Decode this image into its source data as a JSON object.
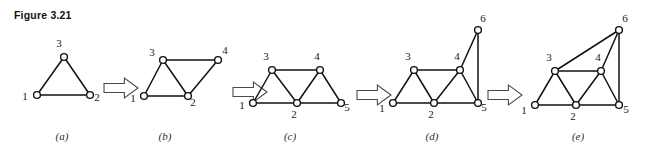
{
  "figure": {
    "caption": "Figure 3.21",
    "background_color": "#ffffff",
    "edge_color": "#111111",
    "vertex_fill_color": "#ffffff",
    "arrow_fill_color": "#ffffff",
    "arrow_stroke_color": "#4a4a4a"
  },
  "panels": [
    {
      "id": "a",
      "label": "(a)",
      "label_x": 62,
      "label_y": 140,
      "vertices": [
        {
          "id": "1",
          "x": 37,
          "y": 95,
          "label": "1",
          "label_x": 25,
          "label_y": 100
        },
        {
          "id": "2",
          "x": 90,
          "y": 95,
          "label": "2",
          "label_x": 97,
          "label_y": 101
        },
        {
          "id": "3",
          "x": 64,
          "y": 57,
          "label": "3",
          "label_x": 59,
          "label_y": 47
        }
      ],
      "edges": [
        {
          "from": "1",
          "to": "2"
        },
        {
          "from": "1",
          "to": "3"
        },
        {
          "from": "2",
          "to": "3"
        }
      ]
    },
    {
      "id": "b",
      "label": "(b)",
      "label_x": 165,
      "label_y": 140,
      "vertices": [
        {
          "id": "1",
          "x": 144,
          "y": 96,
          "label": "1",
          "label_x": 133,
          "label_y": 102
        },
        {
          "id": "2",
          "x": 188,
          "y": 96,
          "label": "2",
          "label_x": 193,
          "label_y": 106
        },
        {
          "id": "3",
          "x": 163,
          "y": 60,
          "label": "3",
          "label_x": 152,
          "label_y": 56
        },
        {
          "id": "4",
          "x": 218,
          "y": 60,
          "label": "4",
          "label_x": 225,
          "label_y": 54
        }
      ],
      "edges": [
        {
          "from": "1",
          "to": "2"
        },
        {
          "from": "1",
          "to": "3"
        },
        {
          "from": "2",
          "to": "3"
        },
        {
          "from": "3",
          "to": "4"
        },
        {
          "from": "2",
          "to": "4"
        }
      ]
    },
    {
      "id": "c",
      "label": "(c)",
      "label_x": 290,
      "label_y": 140,
      "vertices": [
        {
          "id": "1",
          "x": 253,
          "y": 103,
          "label": "1",
          "label_x": 242,
          "label_y": 109
        },
        {
          "id": "2",
          "x": 297,
          "y": 103,
          "label": "2",
          "label_x": 294,
          "label_y": 118
        },
        {
          "id": "3",
          "x": 272,
          "y": 70,
          "label": "3",
          "label_x": 266,
          "label_y": 60
        },
        {
          "id": "4",
          "x": 320,
          "y": 70,
          "label": "4",
          "label_x": 317,
          "label_y": 60
        },
        {
          "id": "5",
          "x": 341,
          "y": 103,
          "label": "5",
          "label_x": 347,
          "label_y": 111
        }
      ],
      "edges": [
        {
          "from": "1",
          "to": "2"
        },
        {
          "from": "2",
          "to": "5"
        },
        {
          "from": "1",
          "to": "3"
        },
        {
          "from": "2",
          "to": "3"
        },
        {
          "from": "3",
          "to": "4"
        },
        {
          "from": "2",
          "to": "4"
        },
        {
          "from": "4",
          "to": "5"
        }
      ]
    },
    {
      "id": "d",
      "label": "(d)",
      "label_x": 432,
      "label_y": 140,
      "vertices": [
        {
          "id": "1",
          "x": 393,
          "y": 103,
          "label": "1",
          "label_x": 382,
          "label_y": 112
        },
        {
          "id": "2",
          "x": 434,
          "y": 103,
          "label": "2",
          "label_x": 431,
          "label_y": 118
        },
        {
          "id": "3",
          "x": 414,
          "y": 70,
          "label": "3",
          "label_x": 408,
          "label_y": 60
        },
        {
          "id": "4",
          "x": 460,
          "y": 70,
          "label": "4",
          "label_x": 457,
          "label_y": 60
        },
        {
          "id": "5",
          "x": 478,
          "y": 103,
          "label": "5",
          "label_x": 484,
          "label_y": 111
        },
        {
          "id": "6",
          "x": 478,
          "y": 30,
          "label": "6",
          "label_x": 483,
          "label_y": 22
        }
      ],
      "edges": [
        {
          "from": "1",
          "to": "2"
        },
        {
          "from": "2",
          "to": "5"
        },
        {
          "from": "1",
          "to": "3"
        },
        {
          "from": "2",
          "to": "3"
        },
        {
          "from": "3",
          "to": "4"
        },
        {
          "from": "2",
          "to": "4"
        },
        {
          "from": "4",
          "to": "5"
        },
        {
          "from": "4",
          "to": "6"
        },
        {
          "from": "5",
          "to": "6"
        }
      ]
    },
    {
      "id": "e",
      "label": "(e)",
      "label_x": 578,
      "label_y": 140,
      "vertices": [
        {
          "id": "1",
          "x": 535,
          "y": 105,
          "label": "1",
          "label_x": 524,
          "label_y": 114
        },
        {
          "id": "2",
          "x": 576,
          "y": 105,
          "label": "2",
          "label_x": 573,
          "label_y": 120
        },
        {
          "id": "3",
          "x": 555,
          "y": 71,
          "label": "3",
          "label_x": 549,
          "label_y": 61
        },
        {
          "id": "4",
          "x": 601,
          "y": 71,
          "label": "4",
          "label_x": 598,
          "label_y": 61
        },
        {
          "id": "5",
          "x": 619,
          "y": 105,
          "label": "5",
          "label_x": 626,
          "label_y": 113
        },
        {
          "id": "6",
          "x": 619,
          "y": 30,
          "label": "6",
          "label_x": 625,
          "label_y": 22
        }
      ],
      "edges": [
        {
          "from": "1",
          "to": "2"
        },
        {
          "from": "2",
          "to": "5"
        },
        {
          "from": "1",
          "to": "3"
        },
        {
          "from": "2",
          "to": "3"
        },
        {
          "from": "3",
          "to": "4"
        },
        {
          "from": "2",
          "to": "4"
        },
        {
          "from": "4",
          "to": "5"
        },
        {
          "from": "4",
          "to": "6"
        },
        {
          "from": "5",
          "to": "6"
        },
        {
          "from": "3",
          "to": "6"
        }
      ]
    }
  ],
  "arrows": [
    {
      "id": "arrow-a-b",
      "x": 104,
      "y": 78,
      "width": 34,
      "height": 20
    },
    {
      "id": "arrow-b-c",
      "x": 233,
      "y": 82,
      "width": 34,
      "height": 20
    },
    {
      "id": "arrow-c-d",
      "x": 357,
      "y": 85,
      "width": 34,
      "height": 20
    },
    {
      "id": "arrow-d-e",
      "x": 488,
      "y": 85,
      "width": 34,
      "height": 20
    }
  ]
}
